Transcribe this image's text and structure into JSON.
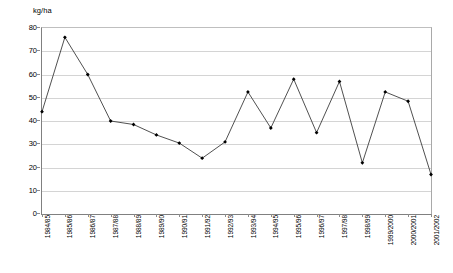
{
  "chart_data": {
    "type": "line",
    "title": "",
    "subtitle": "",
    "xlabel": "",
    "ylabel": "kg/ha",
    "unit_caption": "kg/ha",
    "ylim": [
      0,
      80
    ],
    "ytick_step": 10,
    "yticks": [
      "80",
      "70",
      "60",
      "50",
      "40",
      "30",
      "20",
      "10",
      "0"
    ],
    "grid": true,
    "legend": "none",
    "marker": "filled-diamond",
    "line_color": "#3c3c3c",
    "marker_color": "#000000",
    "grid_color": "#d4d4d4",
    "axis_color": "#808080",
    "categories": [
      "1984/85",
      "1985/86",
      "1986/87",
      "1987/88",
      "1988/89",
      "1989/90",
      "1990/91",
      "1991/92",
      "1992/93",
      "1993/94",
      "1994/95",
      "1995/96",
      "1996/97",
      "1997/98",
      "1998/99",
      "1999/2000",
      "2000/2001",
      "2001/2002"
    ],
    "values": [
      44.0,
      76.0,
      60.0,
      40.0,
      38.5,
      34.0,
      30.5,
      24.0,
      31.0,
      52.5,
      37.0,
      58.0,
      35.0,
      57.0,
      22.0,
      52.5,
      48.5,
      17.0
    ]
  }
}
